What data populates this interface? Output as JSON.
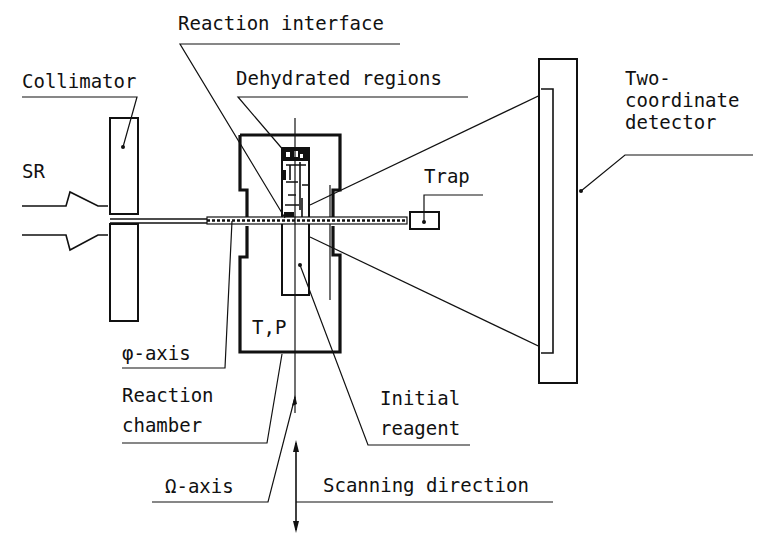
{
  "figure": {
    "labels": {
      "reaction_interface": "Reaction interface",
      "collimator": "Collimator",
      "dehydrated_regions": "Dehydrated regions",
      "two_coordinate_line1": "Two-",
      "two_coordinate_line2": "coordinate",
      "two_coordinate_line3": "detector",
      "sr": "SR",
      "trap": "Trap",
      "tp": "T,P",
      "phi_axis": "φ-axis",
      "reaction_chamber_line1": "Reaction",
      "reaction_chamber_line2": "chamber",
      "initial_reagent_line1": "Initial",
      "initial_reagent_line2": "reagent",
      "omega_axis": "Ω-axis",
      "scanning_direction": "Scanning direction"
    },
    "components": [
      "synchrotron-radiation-beam",
      "collimator",
      "reaction-chamber",
      "sample",
      "trap",
      "two-coordinate-detector",
      "phi-axis",
      "omega-axis",
      "scanning-direction-arrow"
    ],
    "colors": {
      "ink": "#111111",
      "background": "#ffffff"
    }
  }
}
